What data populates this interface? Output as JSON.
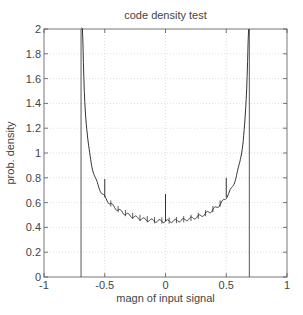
{
  "chart_data": {
    "type": "line",
    "title": "code density test",
    "xlabel": "magn of input signal",
    "ylabel": "prob. density",
    "xlim": [
      -1,
      1
    ],
    "ylim": [
      0,
      2
    ],
    "xticks": [
      -1,
      -0.5,
      0,
      0.5,
      1
    ],
    "xtick_labels": [
      "-1",
      "-0.5",
      "0",
      "0.5",
      "1"
    ],
    "yticks": [
      0,
      0.2,
      0.4,
      0.6,
      0.8,
      1,
      1.2,
      1.4,
      1.6,
      1.8,
      2
    ],
    "ytick_labels": [
      "0",
      "0.2",
      "0.4",
      "0.6",
      "0.8",
      "1",
      "1.2",
      "1.4",
      "1.6",
      "1.8",
      "2"
    ],
    "grid": true,
    "legend": null,
    "series": [
      {
        "name": "measured density (histogram)",
        "description": "arcsine-shaped density, min ~0.45 at 0, diverging near ±0.7",
        "x": [
          -0.69,
          -0.68,
          -0.66,
          -0.64,
          -0.62,
          -0.6,
          -0.55,
          -0.5,
          -0.45,
          -0.4,
          -0.35,
          -0.3,
          -0.2,
          -0.1,
          0,
          0.1,
          0.2,
          0.3,
          0.35,
          0.4,
          0.45,
          0.5,
          0.55,
          0.6,
          0.62,
          0.64,
          0.66,
          0.68,
          0.69
        ],
        "y": [
          2.0,
          1.65,
          1.2,
          1.0,
          0.88,
          0.8,
          0.68,
          0.63,
          0.58,
          0.55,
          0.52,
          0.5,
          0.48,
          0.46,
          0.45,
          0.46,
          0.48,
          0.5,
          0.52,
          0.55,
          0.58,
          0.63,
          0.68,
          0.8,
          0.88,
          1.0,
          1.2,
          1.65,
          2.0
        ]
      },
      {
        "name": "spikes (missing/wide codes)",
        "x": [
          -0.5,
          0,
          0.5
        ],
        "y": [
          0.79,
          0.67,
          0.8
        ]
      },
      {
        "name": "boundary lines",
        "x": [
          -0.695,
          0.69
        ],
        "y_range": [
          0,
          2
        ]
      }
    ]
  }
}
